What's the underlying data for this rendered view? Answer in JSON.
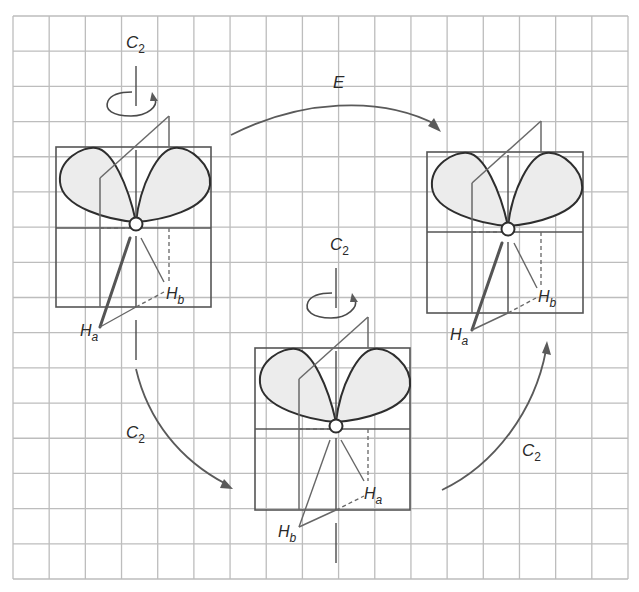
{
  "figure": {
    "colors": {
      "grid": "#bdbdbd",
      "lobe_fill": "#ececec",
      "line": "#2e2e2e",
      "arrow": "#5a5a5a"
    }
  },
  "molecules": [
    {
      "id": "initial",
      "axis_label": {
        "main": "C",
        "sub": "2"
      },
      "front_h": {
        "main": "H",
        "sub": "a"
      },
      "back_h": {
        "main": "H",
        "sub": "b"
      }
    },
    {
      "id": "after-e",
      "front_h": {
        "main": "H",
        "sub": "a"
      },
      "back_h": {
        "main": "H",
        "sub": "b"
      }
    },
    {
      "id": "after-c2",
      "axis_label": {
        "main": "C",
        "sub": "2"
      },
      "front_h": {
        "main": "H",
        "sub": "b"
      },
      "back_h": {
        "main": "H",
        "sub": "a"
      }
    }
  ],
  "operations": [
    {
      "id": "identity",
      "from": "initial",
      "to": "after-e",
      "label": {
        "main": "E",
        "sub": ""
      }
    },
    {
      "id": "c2-down",
      "from": "initial",
      "to": "after-c2",
      "label": {
        "main": "C",
        "sub": "2"
      }
    },
    {
      "id": "c2-up",
      "from": "after-c2",
      "to": "after-e",
      "label": {
        "main": "C",
        "sub": "2"
      }
    }
  ]
}
